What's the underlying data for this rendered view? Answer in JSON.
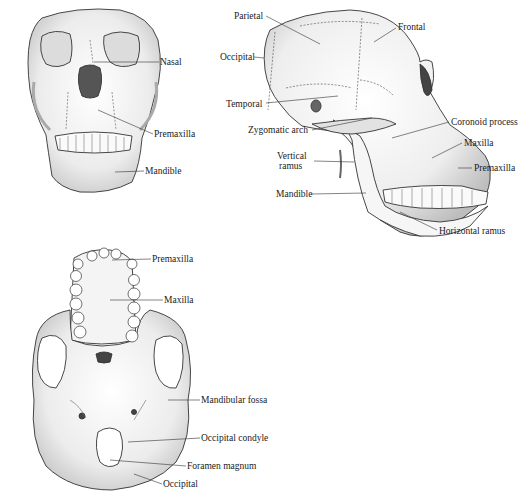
{
  "figure": {
    "views": [
      {
        "id": "front",
        "description": "Frontal view of ape skull",
        "labels": [
          {
            "text": "Nasal",
            "x": 160,
            "y": 58
          },
          {
            "text": "Premaxilla",
            "x": 154,
            "y": 130
          },
          {
            "text": "Mandible",
            "x": 145,
            "y": 167
          }
        ]
      },
      {
        "id": "lateral",
        "description": "Lateral view of ape skull",
        "labels": [
          {
            "text": "Parietal",
            "x": 234,
            "y": 12
          },
          {
            "text": "Frontal",
            "x": 398,
            "y": 23
          },
          {
            "text": "Occipital",
            "x": 220,
            "y": 53
          },
          {
            "text": "Temporal",
            "x": 226,
            "y": 100
          },
          {
            "text": "Zygomatic arch",
            "x": 248,
            "y": 126
          },
          {
            "text": "Coronoid process",
            "x": 451,
            "y": 118
          },
          {
            "text": "Vertical",
            "x": 277,
            "y": 152
          },
          {
            "text": "ramus",
            "x": 277,
            "y": 162
          },
          {
            "text": "Maxilla",
            "x": 464,
            "y": 139
          },
          {
            "text": "Premaxilla",
            "x": 474,
            "y": 164
          },
          {
            "text": "Mandible",
            "x": 276,
            "y": 190
          },
          {
            "text": "Horizontal ramus",
            "x": 439,
            "y": 227
          }
        ]
      },
      {
        "id": "basal",
        "description": "Inferior (basal) view of ape skull",
        "labels": [
          {
            "text": "Premaxilla",
            "x": 152,
            "y": 255
          },
          {
            "text": "Maxilla",
            "x": 164,
            "y": 295
          },
          {
            "text": "Mandibular fossa",
            "x": 201,
            "y": 396
          },
          {
            "text": "Occipital condyle",
            "x": 201,
            "y": 434
          },
          {
            "text": "Foramen magnum",
            "x": 187,
            "y": 462
          },
          {
            "text": "Occipital",
            "x": 163,
            "y": 480
          }
        ]
      }
    ],
    "colors": {
      "background": "#ffffff",
      "bone": "#f1f1f1",
      "shade": "#b8b8b8",
      "outline": "#333333",
      "text": "#1a1a1a"
    }
  }
}
